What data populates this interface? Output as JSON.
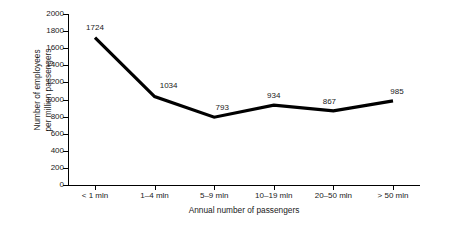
{
  "chart_data": {
    "type": "line",
    "title": "",
    "xlabel": "Annual number of passengers",
    "ylabel": "Number of employees\nper million passengers",
    "categories": [
      "< 1 mln",
      "1–4 mln",
      "5–9 mln",
      "10–19 mln",
      "20–50 mln",
      "> 50 mln"
    ],
    "values": [
      1724,
      1034,
      793,
      934,
      867,
      985
    ],
    "data_labels": [
      "1724",
      "1034",
      "793",
      "934",
      "867",
      "985"
    ],
    "ylim": [
      0,
      2000
    ],
    "ytick_step": 200,
    "yticks": [
      "0",
      "200",
      "400",
      "600",
      "800",
      "1000",
      "1200",
      "1400",
      "1600",
      "1800",
      "2000"
    ],
    "grid": false,
    "legend": "none",
    "series_color": "#000000",
    "axis_color": "#000000",
    "background_color": "#ffffff"
  }
}
